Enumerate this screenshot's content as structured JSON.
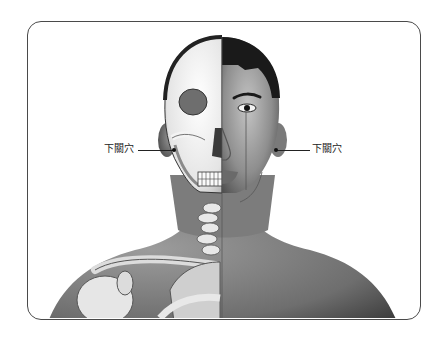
{
  "figure": {
    "colors": {
      "frame": "#4a4a4a",
      "skin_dark": "#5c5c5c",
      "skin_mid": "#8a8a8a",
      "skin_light": "#b5b5b5",
      "bone": "#f0f0f0",
      "hair": "#1a1a1a"
    }
  },
  "labels": {
    "left": "下關穴",
    "right": "下關穴"
  }
}
